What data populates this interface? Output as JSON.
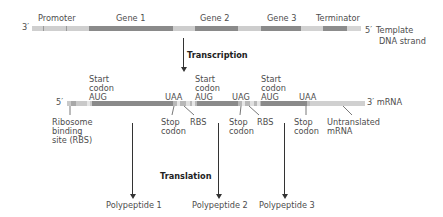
{
  "dna": {
    "end_left": "3′",
    "end_right": "5′",
    "strand_label_line1": "Template",
    "strand_label_line2": "DNA strand",
    "regions": [
      "Promoter",
      "Gene 1",
      "Gene 2",
      "Gene 3",
      "Terminator"
    ]
  },
  "process1": "Transcription",
  "mrna": {
    "end_left": "5′",
    "end_right": "3′ mRNA",
    "above_labels": {
      "start1": [
        "Start",
        "codon",
        "AUG"
      ],
      "stop1": "UAA",
      "start2": [
        "Start",
        "codon",
        "AUG"
      ],
      "stop2": "UAG",
      "start3": [
        "Start",
        "codon",
        "AUG"
      ],
      "stop3": "UAA"
    },
    "below_labels": {
      "rbs1": [
        "Ribosome",
        "binding",
        "site (RBS)"
      ],
      "stop1": [
        "Stop",
        "codon"
      ],
      "rbs2": "RBS",
      "stop2": [
        "Stop",
        "codon"
      ],
      "rbs3": "RBS",
      "stop3": [
        "Stop",
        "codon"
      ],
      "untranslated": [
        "Untranslated",
        "mRNA"
      ]
    }
  },
  "process2": "Translation",
  "products": [
    "Polypeptide 1",
    "Polypeptide 2",
    "Polypeptide 3"
  ],
  "colors": {
    "gene_dark": "#8a8a8a",
    "light": "#c8c8c8",
    "pale": "#dcdcdc",
    "text": "#4d4d4d",
    "arrow": "#333333"
  }
}
